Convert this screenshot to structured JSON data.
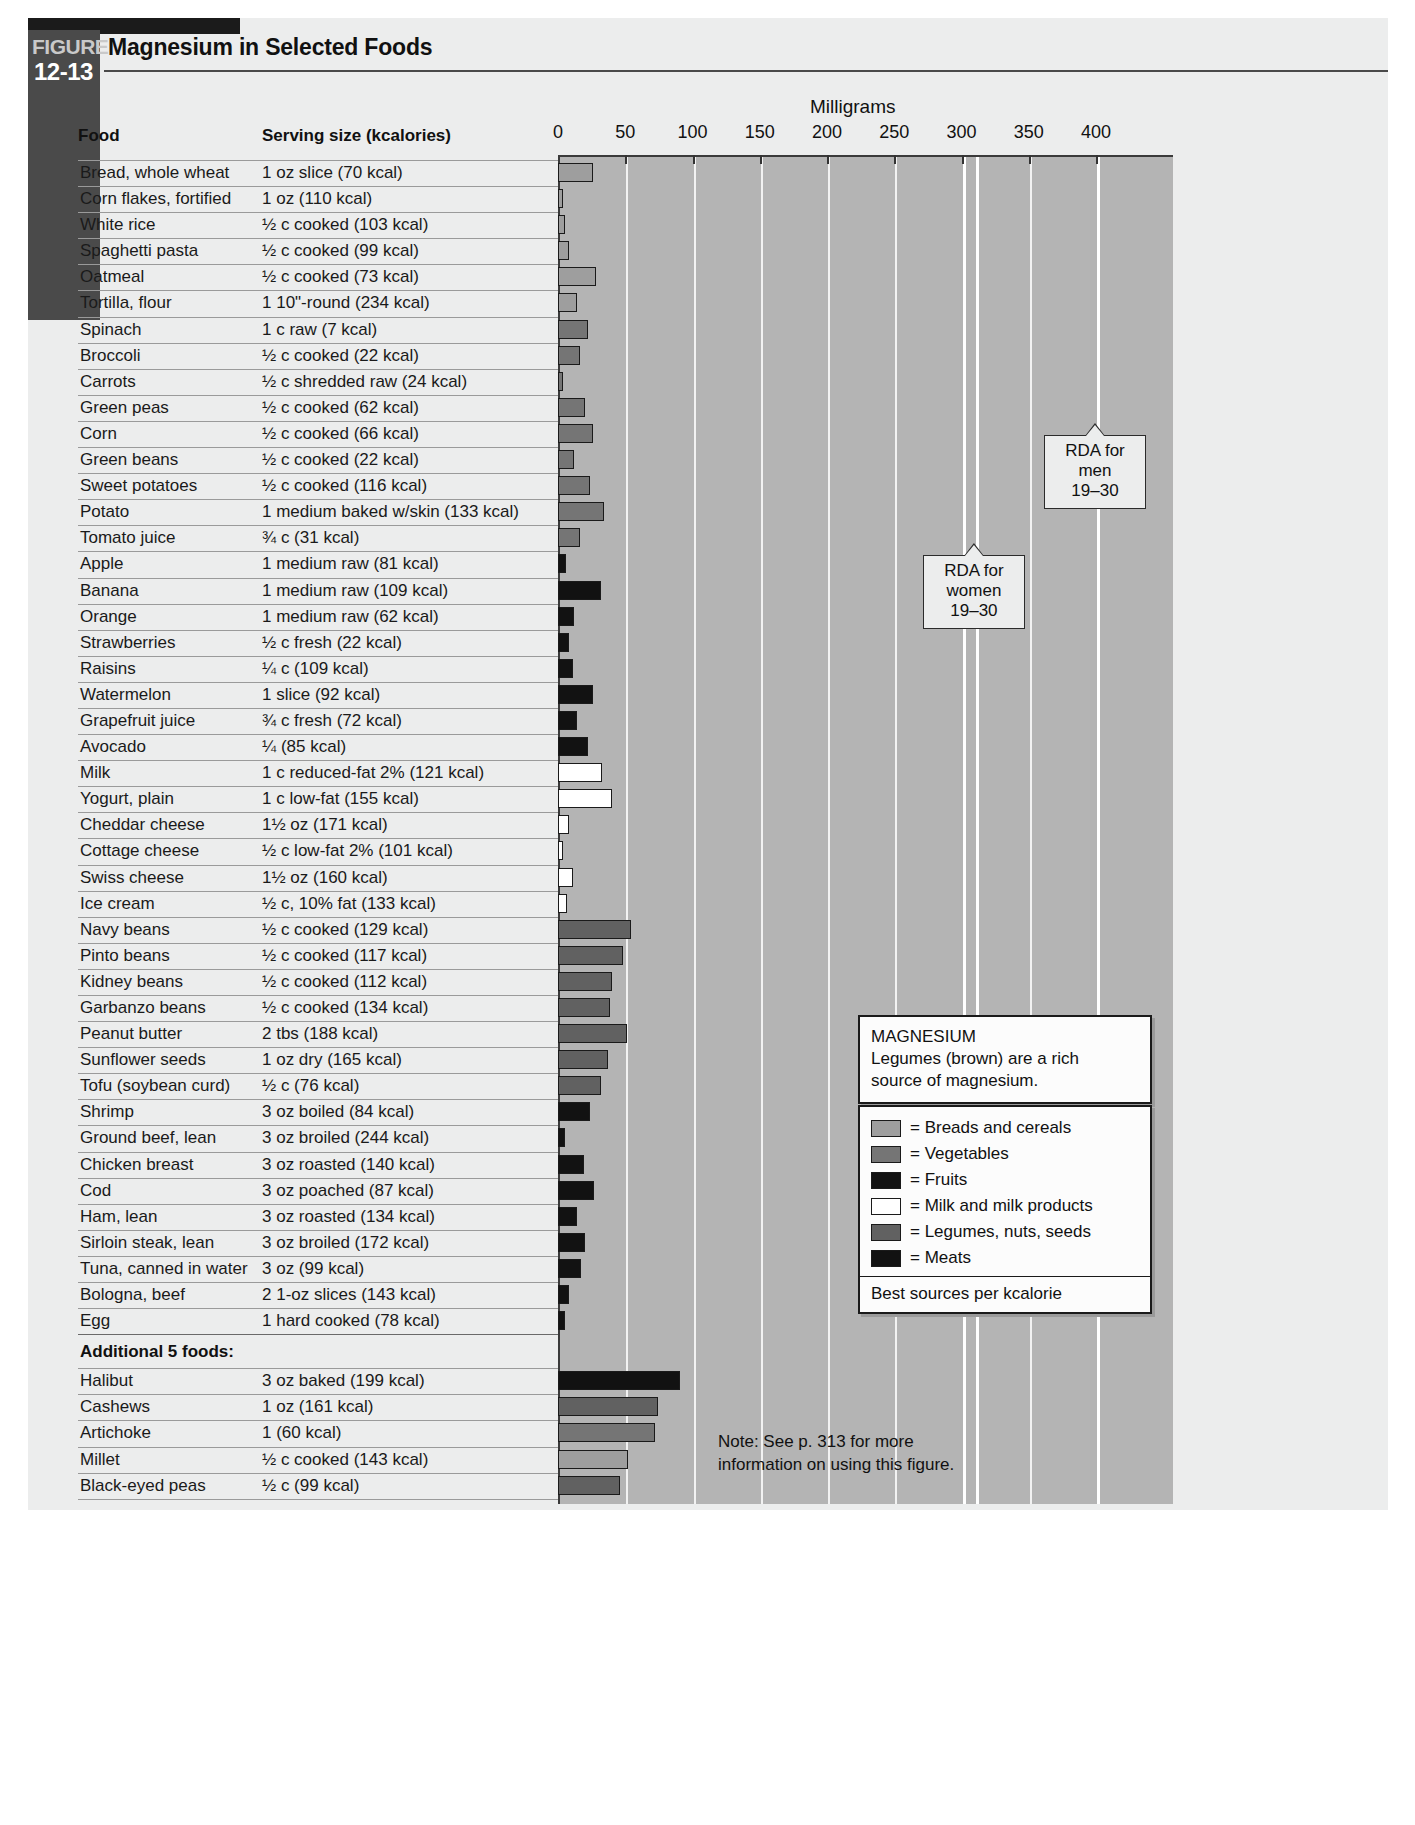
{
  "figure": {
    "word": "FIGURE",
    "number": "12-13",
    "title": "Magnesium in Selected Foods"
  },
  "columns": {
    "food": "Food",
    "serving": "Serving size (kcalories)"
  },
  "axis_title": "Milligrams",
  "additional_header": "Additional 5 foods:",
  "note": "Note: See p. 313 for more\ninformation on using this figure.",
  "info": {
    "title": "MAGNESIUM",
    "body": "Legumes (brown) are a rich\nsource of magnesium."
  },
  "legend": {
    "items": [
      {
        "label": "= Breads and cereals",
        "color": "#9e9e9e",
        "key": "bread"
      },
      {
        "label": "= Vegetables",
        "color": "#757575",
        "key": "veg"
      },
      {
        "label": "= Fruits",
        "color": "#121212",
        "key": "fruit"
      },
      {
        "label": "= Milk and milk products",
        "color": "#ffffff",
        "key": "milk"
      },
      {
        "label": "= Legumes, nuts, seeds",
        "color": "#616161",
        "key": "legume"
      },
      {
        "label": "= Meats",
        "color": "#121212",
        "key": "meat"
      }
    ],
    "footer": "Best sources per kcalorie"
  },
  "rda": [
    {
      "name": "rda-women",
      "lines": [
        "RDA for",
        "women",
        "19–30"
      ],
      "value": 310
    },
    {
      "name": "rda-men",
      "lines": [
        "RDA for",
        "men",
        "19–30"
      ],
      "value": 400
    }
  ],
  "chart_data": {
    "type": "bar",
    "title": "Magnesium in Selected Foods",
    "xlabel": "Milligrams",
    "ylabel": "",
    "xlim": [
      0,
      415
    ],
    "xticks": [
      0,
      50,
      100,
      150,
      200,
      250,
      300,
      350,
      400
    ],
    "grid": true,
    "orientation": "horizontal",
    "categories": [
      "Bread, whole wheat",
      "Corn flakes, fortified",
      "White rice",
      "Spaghetti pasta",
      "Oatmeal",
      "Tortilla, flour",
      "Spinach",
      "Broccoli",
      "Carrots",
      "Green peas",
      "Corn",
      "Green beans",
      "Sweet potatoes",
      "Potato",
      "Tomato juice",
      "Apple",
      "Banana",
      "Orange",
      "Strawberries",
      "Raisins",
      "Watermelon",
      "Grapefruit juice",
      "Avocado",
      "Milk",
      "Yogurt, plain",
      "Cheddar cheese",
      "Cottage cheese",
      "Swiss cheese",
      "Ice cream",
      "Navy beans",
      "Pinto beans",
      "Kidney beans",
      "Garbanzo beans",
      "Peanut butter",
      "Sunflower seeds",
      "Tofu (soybean curd)",
      "Shrimp",
      "Ground beef, lean",
      "Chicken breast",
      "Cod",
      "Ham, lean",
      "Sirloin steak, lean",
      "Tuna, canned in water",
      "Bologna, beef",
      "Egg",
      "Halibut",
      "Cashews",
      "Artichoke",
      "Millet",
      "Black-eyed peas"
    ],
    "values": [
      26,
      2,
      5,
      8,
      28,
      14,
      22,
      16,
      4,
      20,
      26,
      12,
      24,
      34,
      16,
      6,
      32,
      12,
      8,
      11,
      26,
      14,
      22,
      33,
      40,
      8,
      4,
      11,
      7,
      54,
      48,
      40,
      39,
      51,
      37,
      32,
      24,
      5,
      19,
      27,
      14,
      20,
      17,
      8,
      5,
      91,
      74,
      72,
      52,
      46
    ],
    "series_name": "Magnesium (mg)"
  },
  "rows": [
    {
      "food": "Bread, whole wheat",
      "serving": "1 oz slice (70 kcal)",
      "value": 26,
      "group": "bread"
    },
    {
      "food": "Corn flakes, fortified",
      "serving": "1 oz (110 kcal)",
      "value": 2,
      "group": "bread"
    },
    {
      "food": "White rice",
      "serving": "½ c cooked (103 kcal)",
      "value": 5,
      "group": "bread"
    },
    {
      "food": "Spaghetti pasta",
      "serving": "½ c cooked (99 kcal)",
      "value": 8,
      "group": "bread"
    },
    {
      "food": "Oatmeal",
      "serving": "½ c cooked (73 kcal)",
      "value": 28,
      "group": "bread"
    },
    {
      "food": "Tortilla, flour",
      "serving": "1 10\"-round (234 kcal)",
      "value": 14,
      "group": "bread"
    },
    {
      "food": "Spinach",
      "serving": "1 c raw (7 kcal)",
      "value": 22,
      "group": "veg"
    },
    {
      "food": "Broccoli",
      "serving": "½ c cooked (22 kcal)",
      "value": 16,
      "group": "veg"
    },
    {
      "food": "Carrots",
      "serving": "½ c shredded raw (24 kcal)",
      "value": 4,
      "group": "veg"
    },
    {
      "food": "Green peas",
      "serving": "½ c cooked (62 kcal)",
      "value": 20,
      "group": "veg"
    },
    {
      "food": "Corn",
      "serving": "½ c cooked (66 kcal)",
      "value": 26,
      "group": "veg"
    },
    {
      "food": "Green beans",
      "serving": "½ c cooked (22 kcal)",
      "value": 12,
      "group": "veg"
    },
    {
      "food": "Sweet potatoes",
      "serving": "½ c cooked (116 kcal)",
      "value": 24,
      "group": "veg"
    },
    {
      "food": "Potato",
      "serving": "1 medium baked w/skin (133 kcal)",
      "value": 34,
      "group": "veg"
    },
    {
      "food": "Tomato juice",
      "serving": "¾ c (31 kcal)",
      "value": 16,
      "group": "veg"
    },
    {
      "food": "Apple",
      "serving": "1 medium raw (81 kcal)",
      "value": 6,
      "group": "fruit"
    },
    {
      "food": "Banana",
      "serving": "1 medium raw (109 kcal)",
      "value": 32,
      "group": "fruit"
    },
    {
      "food": "Orange",
      "serving": "1 medium raw (62 kcal)",
      "value": 12,
      "group": "fruit"
    },
    {
      "food": "Strawberries",
      "serving": "½ c fresh (22 kcal)",
      "value": 8,
      "group": "fruit"
    },
    {
      "food": "Raisins",
      "serving": "¼ c (109 kcal)",
      "value": 11,
      "group": "fruit"
    },
    {
      "food": "Watermelon",
      "serving": "1 slice (92 kcal)",
      "value": 26,
      "group": "fruit"
    },
    {
      "food": "Grapefruit juice",
      "serving": "¾ c fresh (72 kcal)",
      "value": 14,
      "group": "fruit"
    },
    {
      "food": "Avocado",
      "serving": "¼ (85 kcal)",
      "value": 22,
      "group": "fruit"
    },
    {
      "food": "Milk",
      "serving": "1 c reduced-fat 2% (121 kcal)",
      "value": 33,
      "group": "milk"
    },
    {
      "food": "Yogurt, plain",
      "serving": "1 c low-fat (155 kcal)",
      "value": 40,
      "group": "milk"
    },
    {
      "food": "Cheddar cheese",
      "serving": "1½ oz (171 kcal)",
      "value": 8,
      "group": "milk"
    },
    {
      "food": "Cottage cheese",
      "serving": "½ c low-fat 2% (101 kcal)",
      "value": 4,
      "group": "milk"
    },
    {
      "food": "Swiss cheese",
      "serving": "1½ oz (160 kcal)",
      "value": 11,
      "group": "milk"
    },
    {
      "food": "Ice cream",
      "serving": "½ c, 10% fat (133 kcal)",
      "value": 7,
      "group": "milk"
    },
    {
      "food": "Navy beans",
      "serving": "½ c cooked (129 kcal)",
      "value": 54,
      "group": "legume"
    },
    {
      "food": "Pinto beans",
      "serving": "½ c cooked (117 kcal)",
      "value": 48,
      "group": "legume"
    },
    {
      "food": "Kidney beans",
      "serving": "½ c cooked (112 kcal)",
      "value": 40,
      "group": "legume"
    },
    {
      "food": "Garbanzo beans",
      "serving": "½ c cooked (134 kcal)",
      "value": 39,
      "group": "legume"
    },
    {
      "food": "Peanut butter",
      "serving": "2 tbs (188 kcal)",
      "value": 51,
      "group": "legume"
    },
    {
      "food": "Sunflower seeds",
      "serving": "1 oz dry (165 kcal)",
      "value": 37,
      "group": "legume"
    },
    {
      "food": "Tofu (soybean curd)",
      "serving": "½ c (76 kcal)",
      "value": 32,
      "group": "legume"
    },
    {
      "food": "Shrimp",
      "serving": "3 oz boiled (84 kcal)",
      "value": 24,
      "group": "meat"
    },
    {
      "food": "Ground beef, lean",
      "serving": "3 oz broiled (244 kcal)",
      "value": 5,
      "group": "meat"
    },
    {
      "food": "Chicken breast",
      "serving": "3 oz roasted (140 kcal)",
      "value": 19,
      "group": "meat"
    },
    {
      "food": "Cod",
      "serving": "3 oz poached (87 kcal)",
      "value": 27,
      "group": "meat"
    },
    {
      "food": "Ham, lean",
      "serving": "3 oz roasted (134 kcal)",
      "value": 14,
      "group": "meat"
    },
    {
      "food": "Sirloin steak, lean",
      "serving": "3 oz broiled (172 kcal)",
      "value": 20,
      "group": "meat"
    },
    {
      "food": "Tuna, canned in water",
      "serving": "3 oz (99 kcal)",
      "value": 17,
      "group": "meat"
    },
    {
      "food": "Bologna, beef",
      "serving": "2 1-oz slices (143 kcal)",
      "value": 8,
      "group": "meat"
    },
    {
      "food": "Egg",
      "serving": "1 hard cooked (78 kcal)",
      "value": 5,
      "group": "meat"
    }
  ],
  "additional_rows": [
    {
      "food": "Halibut",
      "serving": "3 oz baked (199 kcal)",
      "value": 91,
      "group": "meat"
    },
    {
      "food": "Cashews",
      "serving": "1 oz (161 kcal)",
      "value": 74,
      "group": "legume"
    },
    {
      "food": "Artichoke",
      "serving": "1 (60 kcal)",
      "value": 72,
      "group": "veg"
    },
    {
      "food": "Millet",
      "serving": "½ c cooked (143 kcal)",
      "value": 52,
      "group": "bread"
    },
    {
      "food": "Black-eyed peas",
      "serving": "½ c (99 kcal)",
      "value": 46,
      "group": "legume"
    }
  ]
}
